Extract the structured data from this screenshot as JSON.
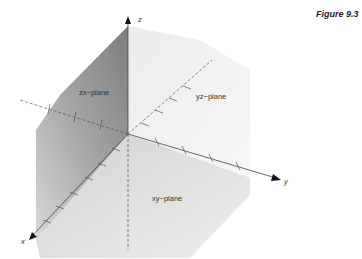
{
  "figure": {
    "label": "Figure 9.3"
  },
  "axes": {
    "x": {
      "label": "x"
    },
    "y": {
      "label": "y"
    },
    "z": {
      "label": "z"
    }
  },
  "planes": {
    "zx": {
      "label": "zx−plane",
      "shade": "#8c8c8c"
    },
    "yz": {
      "label": "yz−plane",
      "shade": "#f1f1f1"
    },
    "xy": {
      "label": "xy−plane",
      "shade": "#dcdcdc"
    }
  },
  "colors": {
    "axis": "#555555",
    "arrow": "#111111"
  }
}
